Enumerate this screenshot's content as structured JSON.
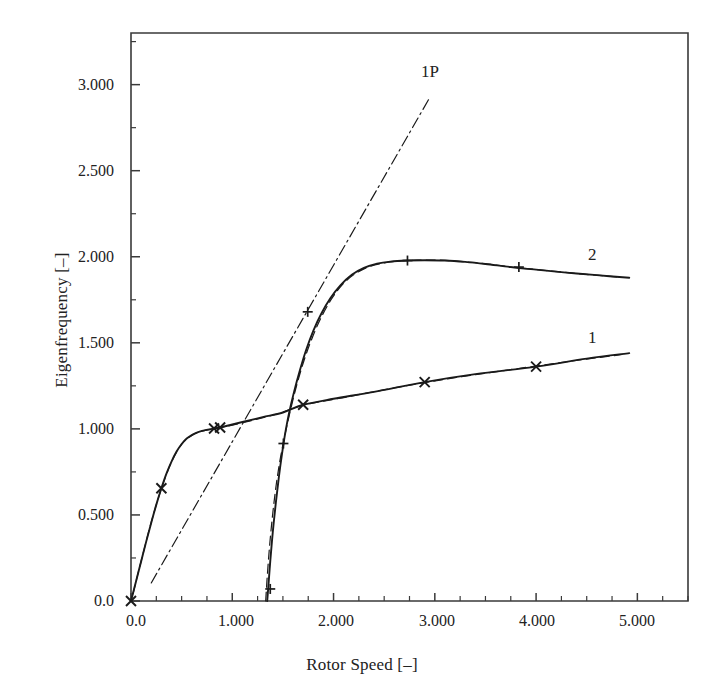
{
  "chart_data": {
    "type": "line",
    "title": "",
    "xlabel": "Rotor Speed [–]",
    "ylabel": "Eigenfrequency [–]",
    "xlim": [
      0.0,
      5.5
    ],
    "ylim": [
      0.0,
      3.3
    ],
    "grid": false,
    "legend": "inline-curve-labels",
    "x_ticks": [
      0.0,
      1.0,
      2.0,
      3.0,
      4.0,
      5.0
    ],
    "x_tick_labels": [
      "0.0",
      "1.000",
      "2.000",
      "3.000",
      "4.000",
      "5.000"
    ],
    "x_minor_ticks": [
      0.25,
      0.5,
      0.75,
      1.25,
      1.5,
      1.75,
      2.25,
      2.5,
      2.75,
      3.25,
      3.5,
      3.75,
      4.25,
      4.5,
      4.75,
      5.25,
      5.5
    ],
    "y_ticks": [
      0.0,
      0.5,
      1.0,
      1.5,
      2.0,
      2.5,
      3.0
    ],
    "y_tick_labels": [
      "0.0",
      "0.500",
      "1.000",
      "1.500",
      "2.000",
      "2.500",
      "3.000"
    ],
    "y_minor_ticks": [
      0.25,
      0.75,
      1.25,
      1.75,
      2.25,
      2.75,
      3.25
    ],
    "series": [
      {
        "name": "1",
        "label": "1",
        "label_x": 4.55,
        "label_y": 1.52,
        "style": "solid",
        "marker": "x",
        "color": "#1a1a1a",
        "points": [
          [
            0.0,
            0.0
          ],
          [
            0.05,
            0.115
          ],
          [
            0.1,
            0.23
          ],
          [
            0.15,
            0.345
          ],
          [
            0.2,
            0.455
          ],
          [
            0.25,
            0.56
          ],
          [
            0.3,
            0.655
          ],
          [
            0.35,
            0.74
          ],
          [
            0.4,
            0.81
          ],
          [
            0.45,
            0.868
          ],
          [
            0.5,
            0.912
          ],
          [
            0.55,
            0.944
          ],
          [
            0.6,
            0.964
          ],
          [
            0.65,
            0.978
          ],
          [
            0.7,
            0.988
          ],
          [
            0.8,
            1.0
          ],
          [
            0.85,
            1.005
          ],
          [
            0.95,
            1.018
          ],
          [
            1.1,
            1.04
          ],
          [
            1.3,
            1.068
          ],
          [
            1.5,
            1.095
          ],
          [
            1.7,
            1.14
          ],
          [
            2.0,
            1.175
          ],
          [
            2.4,
            1.215
          ],
          [
            2.9,
            1.272
          ],
          [
            3.4,
            1.318
          ],
          [
            4.0,
            1.362
          ],
          [
            4.5,
            1.408
          ],
          [
            4.92,
            1.44
          ]
        ],
        "markers": [
          [
            0.0,
            0.0
          ],
          [
            0.3,
            0.655
          ],
          [
            0.82,
            1.002
          ],
          [
            0.88,
            1.008
          ],
          [
            1.7,
            1.14
          ],
          [
            2.9,
            1.272
          ],
          [
            4.0,
            1.362
          ]
        ]
      },
      {
        "name": "2",
        "label": "2",
        "label_x": 4.55,
        "label_y": 1.98,
        "style": "solid",
        "marker": "+",
        "color": "#1a1a1a",
        "points": [
          [
            1.345,
            0.0
          ],
          [
            1.355,
            0.075
          ],
          [
            1.375,
            0.23
          ],
          [
            1.4,
            0.4
          ],
          [
            1.43,
            0.57
          ],
          [
            1.46,
            0.72
          ],
          [
            1.49,
            0.85
          ],
          [
            1.52,
            0.965
          ],
          [
            1.56,
            1.09
          ],
          [
            1.61,
            1.215
          ],
          [
            1.67,
            1.345
          ],
          [
            1.73,
            1.46
          ],
          [
            1.8,
            1.57
          ],
          [
            1.88,
            1.67
          ],
          [
            1.97,
            1.76
          ],
          [
            2.07,
            1.835
          ],
          [
            2.18,
            1.895
          ],
          [
            2.3,
            1.935
          ],
          [
            2.43,
            1.96
          ],
          [
            2.56,
            1.972
          ],
          [
            2.72,
            1.978
          ],
          [
            2.9,
            1.98
          ],
          [
            3.1,
            1.978
          ],
          [
            3.3,
            1.97
          ],
          [
            3.5,
            1.958
          ],
          [
            3.75,
            1.94
          ],
          [
            4.0,
            1.925
          ],
          [
            4.3,
            1.908
          ],
          [
            4.6,
            1.893
          ],
          [
            4.92,
            1.878
          ]
        ],
        "markers": [
          [
            1.375,
            0.07
          ],
          [
            1.505,
            0.915
          ],
          [
            1.745,
            1.68
          ],
          [
            2.73,
            1.978
          ],
          [
            3.83,
            1.94
          ]
        ]
      },
      {
        "name": "1P",
        "label": "1P",
        "label_x": 2.9,
        "label_y": 3.02,
        "style": "dashdot",
        "marker": "none",
        "color": "#1a1a1a",
        "points": [
          [
            0.2,
            0.105
          ],
          [
            2.955,
            2.93
          ]
        ]
      },
      {
        "name": "1-dashed-overlay",
        "label": "",
        "style": "dashed",
        "marker": "none",
        "color": "#1a1a1a",
        "points": [
          [
            0.02,
            0.042
          ],
          [
            0.1,
            0.232
          ],
          [
            0.2,
            0.458
          ],
          [
            0.3,
            0.652
          ],
          [
            0.4,
            0.808
          ],
          [
            0.5,
            0.91
          ],
          [
            0.6,
            0.962
          ],
          [
            0.7,
            0.986
          ],
          [
            0.85,
            1.004
          ],
          [
            1.0,
            1.022
          ],
          [
            1.2,
            1.05
          ],
          [
            1.45,
            1.088
          ],
          [
            1.7,
            1.138
          ],
          [
            2.1,
            1.182
          ],
          [
            2.6,
            1.238
          ],
          [
            3.1,
            1.288
          ],
          [
            3.7,
            1.34
          ],
          [
            4.3,
            1.39
          ],
          [
            4.85,
            1.432
          ]
        ]
      },
      {
        "name": "2-dashed-overlay",
        "label": "",
        "style": "dashed",
        "marker": "none",
        "color": "#1a1a1a",
        "points": [
          [
            1.33,
            0.0
          ],
          [
            1.345,
            0.14
          ],
          [
            1.37,
            0.33
          ],
          [
            1.4,
            0.51
          ],
          [
            1.435,
            0.68
          ],
          [
            1.475,
            0.83
          ],
          [
            1.52,
            0.965
          ],
          [
            1.575,
            1.11
          ],
          [
            1.64,
            1.262
          ],
          [
            1.71,
            1.4
          ],
          [
            1.79,
            1.53
          ],
          [
            1.88,
            1.65
          ],
          [
            1.98,
            1.755
          ],
          [
            2.09,
            1.84
          ],
          [
            2.21,
            1.9
          ],
          [
            2.34,
            1.94
          ],
          [
            2.48,
            1.962
          ],
          [
            2.64,
            1.974
          ],
          [
            2.83,
            1.98
          ],
          [
            3.05,
            1.98
          ],
          [
            3.28,
            1.972
          ],
          [
            3.52,
            1.958
          ],
          [
            3.8,
            1.938
          ],
          [
            4.1,
            1.92
          ],
          [
            4.45,
            1.9
          ],
          [
            4.82,
            1.882
          ]
        ]
      }
    ]
  },
  "axes": {
    "frame_color": "#3a3a3a"
  }
}
